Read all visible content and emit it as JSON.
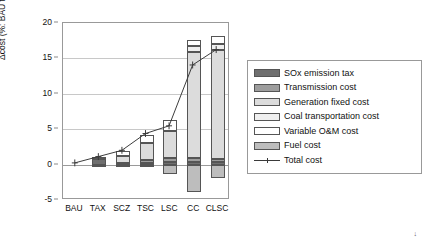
{
  "chart_data": {
    "type": "bar",
    "subtype": "stacked-bar-with-line-overlay",
    "title": "",
    "xlabel": "",
    "ylabel": "Δcost (%: BAU total cost = 100%)",
    "ylim": [
      -5,
      20
    ],
    "yticks": [
      -5,
      0,
      5,
      10,
      15,
      20
    ],
    "ytick_labels": [
      "-5",
      "0",
      "5",
      "10",
      "15",
      "20"
    ],
    "grid": true,
    "legend_position": "right",
    "categories": [
      "BAU",
      "TAX",
      "SCZ",
      "TSC",
      "LSC",
      "CC",
      "CLSC"
    ],
    "series": [
      {
        "name": "SOx emission tax",
        "key": "sox",
        "color": "#6f6f6f",
        "values": [
          0,
          0.8,
          0.2,
          0.25,
          0.3,
          0.35,
          0.3
        ]
      },
      {
        "name": "Transmission cost",
        "key": "trans",
        "color": "#9d9d9d",
        "values": [
          0,
          0.0,
          0.0,
          0.45,
          0.7,
          0.6,
          0.5
        ]
      },
      {
        "name": "Generation fixed cost",
        "key": "genfix",
        "color": "#dcdcdc",
        "values": [
          0,
          0.0,
          1.0,
          2.3,
          3.8,
          14.9,
          15.4
        ]
      },
      {
        "name": "Coal transportation cost",
        "key": "coal",
        "color": "#efefef",
        "values": [
          0,
          0.0,
          0.0,
          0.0,
          0.0,
          0.9,
          0.9
        ]
      },
      {
        "name": "Variable O&M cost",
        "key": "vom",
        "color": "#ffffff",
        "values": [
          0,
          0.25,
          0.7,
          1.2,
          1.5,
          0.9,
          1.0
        ]
      },
      {
        "name": "Fuel cost",
        "key": "fuel",
        "color": "#bdbdbd",
        "values": [
          0,
          -0.05,
          -0.1,
          -0.35,
          -1.35,
          -3.9,
          -1.9
        ]
      }
    ],
    "negative_series_keys": [
      "fuel"
    ],
    "line_series": {
      "name": "Total cost",
      "marker": "plus",
      "color": "#3a3a3a",
      "values": [
        0.0,
        0.9,
        1.8,
        4.2,
        5.3,
        14.0,
        16.2
      ]
    }
  },
  "axes": {
    "y_label": "Δcost (%: BAU total cost = 100%)",
    "y_ticks": [
      "20",
      "15",
      "10",
      "5",
      "0",
      "-5"
    ],
    "x_ticks": [
      "BAU",
      "TAX",
      "SCZ",
      "TSC",
      "LSC",
      "CC",
      "CLSC"
    ]
  },
  "legend": {
    "items": [
      {
        "label": "SOx emission tax",
        "swatch": "swatch-sox"
      },
      {
        "label": "Transmission cost",
        "swatch": "swatch-transmission"
      },
      {
        "label": "Generation fixed cost",
        "swatch": "swatch-generation-fixed"
      },
      {
        "label": "Coal transportation cost",
        "swatch": "swatch-coal-transportation"
      },
      {
        "label": "Variable O&M cost",
        "swatch": "swatch-variable-om"
      },
      {
        "label": "Fuel cost",
        "swatch": "swatch-fuel"
      }
    ],
    "line_item": {
      "label": "Total cost",
      "marker": "plus-marker"
    }
  },
  "footer": {
    "corner_mark": "↓"
  }
}
